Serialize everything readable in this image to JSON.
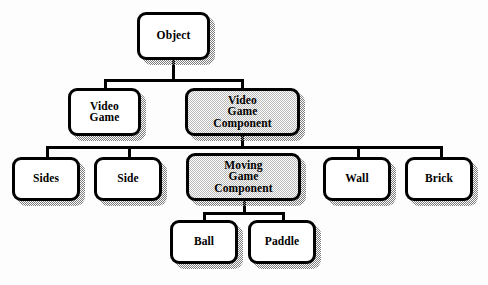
{
  "diagram": {
    "type": "class-hierarchy-tree",
    "title": "",
    "background_color": "#fdfdfd",
    "border_color": "#000000",
    "white_fill": "#ffffff",
    "gray_fill": "#d2d2d2",
    "shadow_color": "#808080",
    "nodes": [
      {
        "id": "object",
        "label": "Object",
        "fill": "white",
        "x": 137,
        "y": 12,
        "w": 73,
        "h": 48,
        "level": 0,
        "parent": null
      },
      {
        "id": "video-game",
        "label": "Video\nGame",
        "fill": "white",
        "x": 68,
        "y": 88,
        "w": 73,
        "h": 48,
        "level": 1,
        "parent": "object"
      },
      {
        "id": "video-game-component",
        "label": "Video\nGame\nComponent",
        "fill": "gray",
        "x": 185,
        "y": 88,
        "w": 115,
        "h": 48,
        "level": 1,
        "parent": "object"
      },
      {
        "id": "sides",
        "label": "Sides",
        "fill": "white",
        "x": 12,
        "y": 157,
        "w": 68,
        "h": 44,
        "level": 2,
        "parent": "video-game-component"
      },
      {
        "id": "side",
        "label": "Side",
        "fill": "white",
        "x": 94,
        "y": 157,
        "w": 68,
        "h": 44,
        "level": 2,
        "parent": "video-game-component"
      },
      {
        "id": "moving-game-component",
        "label": "Moving\nGame\nComponent",
        "fill": "gray",
        "x": 186,
        "y": 153,
        "w": 115,
        "h": 48,
        "level": 2,
        "parent": "video-game-component"
      },
      {
        "id": "wall",
        "label": "Wall",
        "fill": "white",
        "x": 323,
        "y": 157,
        "w": 68,
        "h": 44,
        "level": 2,
        "parent": "video-game-component"
      },
      {
        "id": "brick",
        "label": "Brick",
        "fill": "white",
        "x": 405,
        "y": 157,
        "w": 68,
        "h": 44,
        "level": 2,
        "parent": "video-game-component"
      },
      {
        "id": "ball",
        "label": "Ball",
        "fill": "white",
        "x": 170,
        "y": 220,
        "w": 68,
        "h": 44,
        "level": 3,
        "parent": "moving-game-component"
      },
      {
        "id": "paddle",
        "label": "Paddle",
        "fill": "white",
        "x": 248,
        "y": 220,
        "w": 68,
        "h": 44,
        "level": 3,
        "parent": "moving-game-component"
      }
    ],
    "edges": [
      {
        "id": "object-drop",
        "from": "object",
        "to": "bus-1",
        "orient": "v",
        "x": 172,
        "y": 60,
        "len": 19
      },
      {
        "id": "bus-1",
        "from": "object",
        "to": "level-1",
        "orient": "h",
        "x": 104,
        "y": 79,
        "len": 140
      },
      {
        "id": "video-game-stub",
        "from": "bus-1",
        "to": "video-game",
        "orient": "v",
        "x": 104,
        "y": 79,
        "len": 10
      },
      {
        "id": "vgc-stub",
        "from": "bus-1",
        "to": "video-game-component",
        "orient": "v",
        "x": 241,
        "y": 79,
        "len": 10
      },
      {
        "id": "vgc-drop",
        "from": "video-game-component",
        "to": "bus-2",
        "orient": "v",
        "x": 241,
        "y": 136,
        "len": 13
      },
      {
        "id": "bus-2",
        "from": "video-game-component",
        "to": "level-2",
        "orient": "h",
        "x": 46,
        "y": 146,
        "len": 397
      },
      {
        "id": "sides-stub",
        "from": "bus-2",
        "to": "sides",
        "orient": "v",
        "x": 46,
        "y": 146,
        "len": 12
      },
      {
        "id": "side-stub",
        "from": "bus-2",
        "to": "side",
        "orient": "v",
        "x": 128,
        "y": 146,
        "len": 12
      },
      {
        "id": "wall-stub",
        "from": "bus-2",
        "to": "wall",
        "orient": "v",
        "x": 357,
        "y": 146,
        "len": 12
      },
      {
        "id": "brick-stub",
        "from": "bus-2",
        "to": "brick",
        "orient": "v",
        "x": 440,
        "y": 146,
        "len": 12
      },
      {
        "id": "mgc-drop",
        "from": "moving-game-component",
        "to": "bus-3",
        "orient": "v",
        "x": 243,
        "y": 201,
        "len": 13
      },
      {
        "id": "bus-3",
        "from": "moving-game-component",
        "to": "level-3",
        "orient": "h",
        "x": 203,
        "y": 212,
        "len": 82
      },
      {
        "id": "ball-stub",
        "from": "bus-3",
        "to": "ball",
        "orient": "v",
        "x": 203,
        "y": 212,
        "len": 10
      },
      {
        "id": "paddle-stub",
        "from": "bus-3",
        "to": "paddle",
        "orient": "v",
        "x": 282,
        "y": 212,
        "len": 10
      }
    ]
  }
}
